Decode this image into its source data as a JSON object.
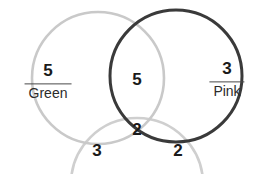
{
  "diagram": {
    "type": "venn",
    "set_count": 3,
    "background_color": "#ffffff",
    "circles": [
      {
        "id": "green",
        "name": "Green",
        "stroke_color": "#c9c9c9",
        "stroke_width": 2.6,
        "cx": 98,
        "cy": 78,
        "r": 66,
        "cropped": false
      },
      {
        "id": "pink",
        "name": "Pink",
        "stroke_color": "#3a3a3a",
        "stroke_width": 3.0,
        "cx": 176,
        "cy": 76,
        "r": 66,
        "cropped": false
      },
      {
        "id": "third",
        "name": "",
        "stroke_color": "#cfcfcf",
        "stroke_width": 2.6,
        "cx": 137,
        "cy": 184,
        "r": 66,
        "cropped": true
      }
    ],
    "set_labels": [
      {
        "id": "green-label",
        "count": "5",
        "name": "Green",
        "x": 48,
        "y": 82
      },
      {
        "id": "pink-label",
        "count": "3",
        "name": "Pink",
        "x": 227,
        "y": 80
      }
    ],
    "region_values": [
      {
        "id": "green-pink-only",
        "value": "5",
        "x": 137,
        "y": 79
      },
      {
        "id": "all-three",
        "value": "2",
        "x": 137,
        "y": 129
      },
      {
        "id": "green-third-only",
        "value": "3",
        "x": 97,
        "y": 150
      },
      {
        "id": "pink-third-only",
        "value": "2",
        "x": 178,
        "y": 150
      }
    ]
  }
}
